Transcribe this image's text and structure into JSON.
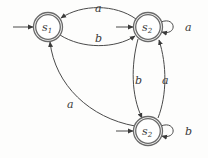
{
  "diagram": {
    "type": "finite-automaton",
    "states": [
      {
        "id": "s1",
        "label": "s",
        "subscript": "1",
        "cx": 48,
        "cy": 27,
        "accepting": true,
        "initial": true
      },
      {
        "id": "s2_top",
        "label": "s",
        "subscript": "2",
        "cx": 148,
        "cy": 27,
        "accepting": true,
        "initial": true
      },
      {
        "id": "s2_bottom",
        "label": "s",
        "subscript": "2",
        "cx": 148,
        "cy": 131,
        "accepting": true,
        "initial": true
      }
    ],
    "transitions": [
      {
        "from": "s2_top",
        "to": "s1",
        "label": "a"
      },
      {
        "from": "s1",
        "to": "s2_top",
        "label": "b"
      },
      {
        "from": "s2_top",
        "to": "s2_top",
        "label": "a"
      },
      {
        "from": "s2_top",
        "to": "s2_bottom",
        "label": "b"
      },
      {
        "from": "s2_bottom",
        "to": "s2_top",
        "label": "a"
      },
      {
        "from": "s2_bottom",
        "to": "s1",
        "label": "a"
      },
      {
        "from": "s2_bottom",
        "to": "s2_bottom",
        "label": "b"
      }
    ],
    "colors": {
      "stroke": "#4a4a4a",
      "ring": "#6a6a6a",
      "text": "#3a3a3a"
    }
  }
}
